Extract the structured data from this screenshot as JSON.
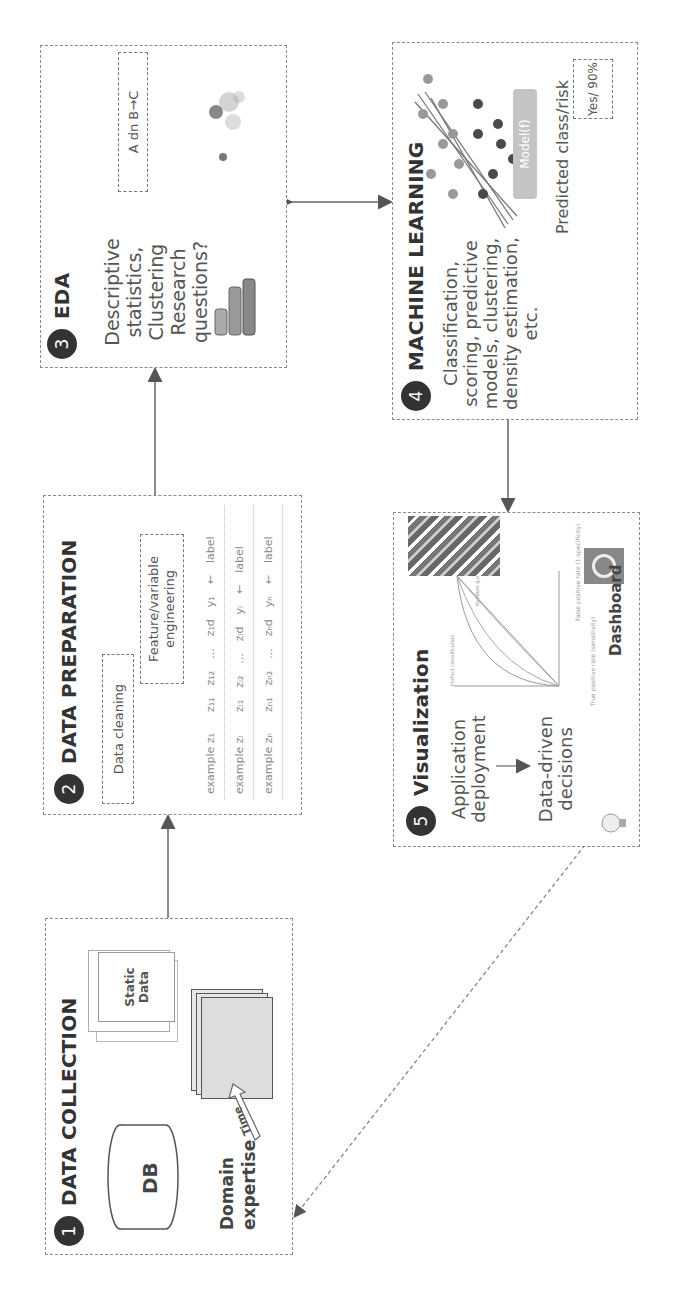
{
  "steps": [
    {
      "number": "1",
      "title": "DATA COLLECTION",
      "db_label": "DB",
      "static_data_label": "Static Data",
      "time_label": "Time",
      "domain_expertise": "Domain expertise"
    },
    {
      "number": "2",
      "title": "DATA PREPARATION",
      "data_cleaning": "Data cleaning",
      "feature_engineering": "Feature/variable engineering",
      "table_rows": [
        [
          "example z₁",
          "z₁₁",
          "z₁₂",
          "...",
          "z₁d",
          "y₁",
          "←",
          "label"
        ],
        [
          "example zᵢ",
          "zᵢ₁",
          "zᵢ₂",
          "...",
          "zᵢd",
          "yᵢ",
          "←",
          "label"
        ],
        [
          "example zₙ",
          "zₙ₁",
          "zₙ₂",
          "...",
          "zₙd",
          "yₙ",
          "←",
          "label"
        ]
      ]
    },
    {
      "number": "3",
      "title": "EDA",
      "description": "Descriptive statistics, Clustering Research questions?",
      "rule_label": "A dn B→C"
    },
    {
      "number": "4",
      "title": "MACHINE LEARNING",
      "description": "Classification, scoring, predictive models, clustering, density estimation, etc.",
      "model_label": "Model(f)",
      "predicted_label": "Predicted class/risk",
      "prediction_value": "Yes/ 90%"
    },
    {
      "number": "5",
      "title": "Visualization",
      "app_deployment": "Application deployment",
      "data_driven": "Data-driven decisions",
      "dashboard_label": "Dashboard",
      "roc_y_label": "True positive rate (sensitivity)",
      "roc_x_label": "False positive rate (1-specificity)",
      "roc_perfect_label": "Perfect classification",
      "roc_random_label": "Random guess"
    }
  ],
  "colors": {
    "badge": "#333333",
    "border": "#8a8a8a",
    "text": "#555555",
    "model_box": "#c4c4c4",
    "dot_dark": "#4a4a4a",
    "dot_light": "#8a8a8a"
  }
}
